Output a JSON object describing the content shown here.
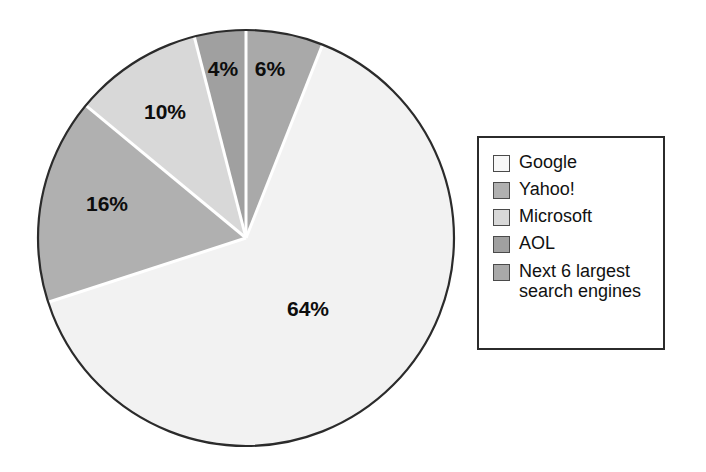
{
  "chart_data": {
    "type": "pie",
    "title": "",
    "subtitle": "",
    "xlabel": "",
    "ylabel": "",
    "legend_position": "right",
    "grid": false,
    "unit": "%",
    "start_angle_deg": 0,
    "direction": "clockwise",
    "categories": [
      "Google",
      "Yahoo!",
      "Microsoft",
      "AOL",
      "Next 6 largest\nsearch engines"
    ],
    "values": [
      64,
      16,
      10,
      4,
      6
    ],
    "data_labels": [
      "64%",
      "16%",
      "10%",
      "4%",
      "6%"
    ],
    "colors": [
      "#f2f2f2",
      "#b0b0b0",
      "#d8d8d8",
      "#a0a0a0",
      "#a9a9a9"
    ],
    "slices": [
      {
        "name": "Google",
        "value": 64,
        "label": "64%",
        "color": "#f2f2f2",
        "start_angle": 21.6,
        "end_angle": 252.0,
        "label_x": 308,
        "label_y": 310
      },
      {
        "name": "Yahoo!",
        "value": 16,
        "label": "16%",
        "color": "#b0b0b0",
        "start_angle": 252.0,
        "end_angle": 309.6,
        "label_x": 107,
        "label_y": 205
      },
      {
        "name": "Microsoft",
        "value": 10,
        "label": "10%",
        "color": "#d8d8d8",
        "start_angle": 309.6,
        "end_angle": 345.6,
        "label_x": 165,
        "label_y": 113
      },
      {
        "name": "AOL",
        "value": 4,
        "label": "4%",
        "color": "#a0a0a0",
        "start_angle": 345.6,
        "end_angle": 360.0,
        "label_x": 223,
        "label_y": 70
      },
      {
        "name": "Next 6 largest search engines",
        "value": 6,
        "label": "6%",
        "color": "#a9a9a9",
        "start_angle": 0.0,
        "end_angle": 21.6,
        "label_x": 270,
        "label_y": 70
      }
    ],
    "geometry": {
      "center_x": 246,
      "center_y": 238,
      "radius": 208,
      "outline_color": "#2b2b2b",
      "separator_color": "#ffffff"
    }
  },
  "legend": {
    "items": [
      {
        "label": "Google",
        "color": "#f7f7f7"
      },
      {
        "label": "Yahoo!",
        "color": "#b0b0b0"
      },
      {
        "label": "Microsoft",
        "color": "#d8d8d8"
      },
      {
        "label": "AOL",
        "color": "#a0a0a0"
      },
      {
        "label": "Next 6 largest\nsearch engines",
        "color": "#a9a9a9"
      }
    ]
  }
}
